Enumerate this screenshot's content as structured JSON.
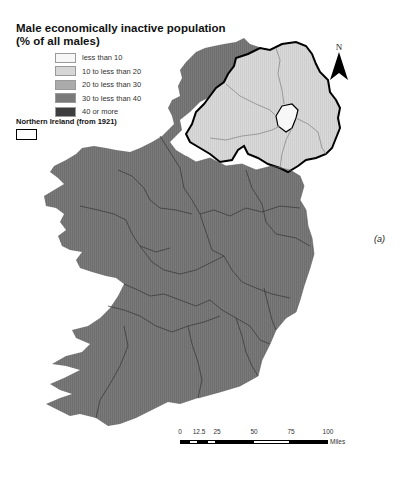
{
  "title": {
    "line1": "Male economically inactive population",
    "line2": "(% of all males)"
  },
  "legend": {
    "items": [
      {
        "label": "less than 10",
        "color": "#f7f7f7"
      },
      {
        "label": "10 to less than 20",
        "color": "#d6d6d6"
      },
      {
        "label": "20 to less than 30",
        "color": "#ababab"
      },
      {
        "label": "30 to less than 40",
        "color": "#7a7a7a"
      },
      {
        "label": "40 or more",
        "color": "#3d3d3d"
      }
    ],
    "ni_label": "Northern Ireland (from 1921)"
  },
  "north_arrow": {
    "letter": "N"
  },
  "panel_label": "(a)",
  "scale_bar": {
    "ticks": [
      "0",
      "12.5",
      "25",
      "50",
      "75",
      "100"
    ],
    "unit": "Miles"
  },
  "map": {
    "republic_fill": "#7a7a7a",
    "ni_fill": "#d6d6d6",
    "belfast_fill": "#f7f7f7",
    "border_color": "#000000",
    "county_line_color": "#3a3a3a"
  }
}
